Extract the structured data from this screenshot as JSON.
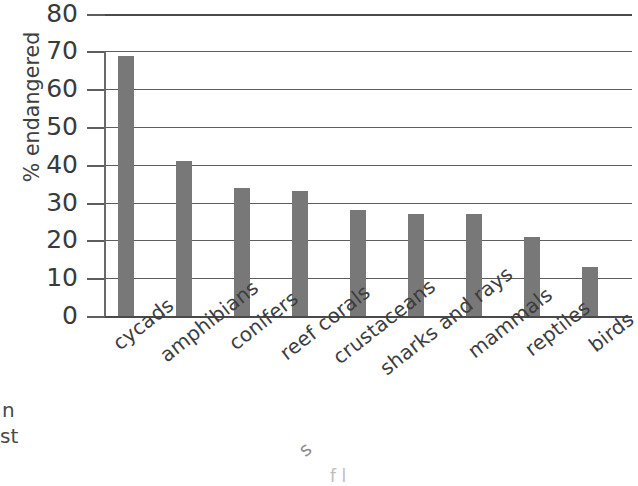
{
  "chart_data": {
    "type": "bar",
    "title": "",
    "subtitle": "",
    "xlabel": "",
    "ylabel": "% endangered",
    "ylim": [
      0,
      80
    ],
    "yticks": [
      0,
      10,
      20,
      30,
      40,
      50,
      60,
      70,
      80
    ],
    "ytick_labels": [
      "0",
      "10",
      "20",
      "30",
      "40",
      "50",
      "60",
      "70",
      "80"
    ],
    "grid": true,
    "grid_axis": "y",
    "legend": false,
    "legend_position": "none",
    "orientation": "vertical",
    "bar_color": "#787878",
    "categories": [
      "cycads",
      "amphibians",
      "conifers",
      "reef corals",
      "crustaceans",
      "sharks and rays",
      "mammals",
      "reptiles",
      "birds"
    ],
    "values": [
      69,
      41,
      34,
      33,
      28,
      27,
      27,
      21,
      13
    ],
    "points": [
      {
        "category": "cycads",
        "value": 69
      },
      {
        "category": "amphibians",
        "value": 41
      },
      {
        "category": "conifers",
        "value": 34
      },
      {
        "category": "reef corals",
        "value": 33
      },
      {
        "category": "crustaceans",
        "value": 28
      },
      {
        "category": "sharks and rays",
        "value": 27
      },
      {
        "category": "mammals",
        "value": 27
      },
      {
        "category": "reptiles",
        "value": 21
      },
      {
        "category": "birds",
        "value": 13
      }
    ],
    "annotations": []
  },
  "edge_fragments": {
    "left_upper": "n",
    "left_lower": "st",
    "bottom_curve": "s",
    "bottom_faint": "f    l"
  },
  "colors": {
    "bar": "#787878",
    "gridline": "#5e5e5e",
    "axis": "#4a4a4a",
    "text": "#3a3a3a",
    "background": "#ffffff"
  }
}
